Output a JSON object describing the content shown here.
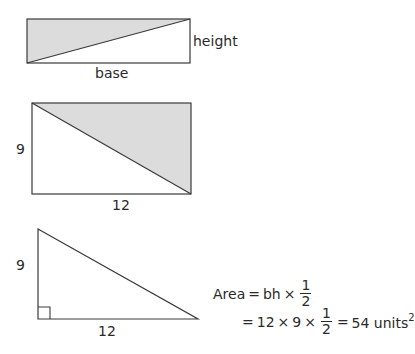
{
  "colors": {
    "stroke": "#3a3a3a",
    "shade": "#dcdcdc",
    "background": "#ffffff"
  },
  "figure1": {
    "base_label": "base",
    "height_label": "height"
  },
  "figure2": {
    "height_label": "9",
    "base_label": "12"
  },
  "figure3": {
    "height_label": "9",
    "base_label": "12"
  },
  "formula": {
    "line1": {
      "lhs": "Area",
      "eq": "=",
      "term": "bh",
      "times": "×",
      "frac_num": "1",
      "frac_den": "2"
    },
    "line2": {
      "eq1": "=",
      "a": "12",
      "times1": "×",
      "b": "9",
      "times2": "×",
      "frac_num": "1",
      "frac_den": "2",
      "eq2": "=",
      "result": "54 units",
      "exponent": "2"
    }
  }
}
